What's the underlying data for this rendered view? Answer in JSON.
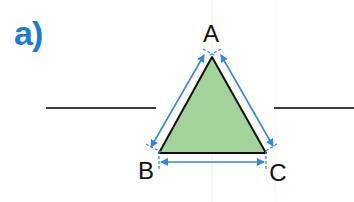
{
  "exercise": {
    "part_label": "a)"
  },
  "figure": {
    "type": "triangle",
    "vertices": [
      {
        "name": "A",
        "x": 212,
        "y": 57,
        "label_x": 211,
        "label_y": 42
      },
      {
        "name": "B",
        "x": 159,
        "y": 153,
        "label_x": 146,
        "label_y": 179
      },
      {
        "name": "C",
        "x": 266,
        "y": 153,
        "label_x": 278,
        "label_y": 181
      }
    ],
    "sides": [
      "AB",
      "BC",
      "CA"
    ],
    "fill_color": "#a3d39a",
    "outline_color": "#111111",
    "measure_arrow_color": "#3a86d0",
    "guide_lines": [
      {
        "x1": 46,
        "y1": 108,
        "x2": 156,
        "y2": 108
      },
      {
        "x1": 274,
        "y1": 108,
        "x2": 354,
        "y2": 108
      }
    ]
  }
}
